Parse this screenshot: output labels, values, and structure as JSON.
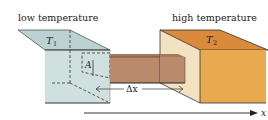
{
  "labels": {
    "low_temperature": "low temperature",
    "high_temperature": "high temperature",
    "t1": "T",
    "t1_sub": "1",
    "t2": "T",
    "t2_sub": "2",
    "area": "A",
    "delta_x": "Δx",
    "axis": "x"
  },
  "colors": {
    "cold_block_front": "#cfe0df",
    "cold_block_top": "#bcd2d2",
    "cold_block_side": "#dcebea",
    "rod_front": "#b98a6c",
    "rod_top": "#a77a60",
    "hot_block_front": "#e9a94f",
    "hot_block_top": "#d98a3a",
    "hot_block_side": "#f3e2c2",
    "outline": "#333333"
  }
}
